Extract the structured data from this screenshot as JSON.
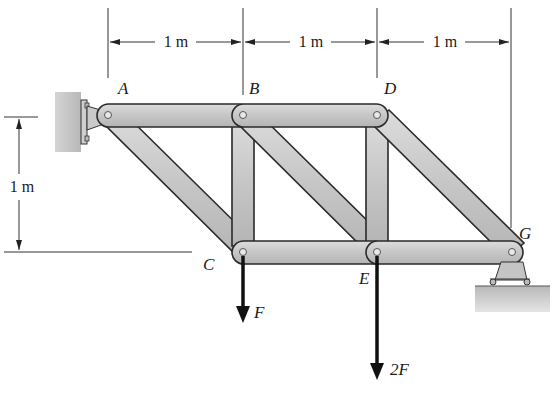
{
  "figure": {
    "type": "truss-diagram",
    "dimensions": {
      "horizontal": [
        {
          "label": "1 m",
          "from": "A",
          "to": "B"
        },
        {
          "label": "1 m",
          "from": "B",
          "to": "D"
        },
        {
          "label": "1 m",
          "from": "D",
          "to": "G"
        }
      ],
      "vertical": {
        "label": "1 m",
        "from": "A",
        "to": "C"
      }
    },
    "joints": {
      "A": {
        "label": "A"
      },
      "B": {
        "label": "B"
      },
      "C": {
        "label": "C"
      },
      "D": {
        "label": "D"
      },
      "E": {
        "label": "E"
      },
      "G": {
        "label": "G"
      }
    },
    "members": [
      "AB",
      "BD",
      "AC",
      "BC",
      "BE",
      "DE",
      "DG",
      "CE",
      "EG"
    ],
    "supports": {
      "A": "pin (wall)",
      "G": "roller (ground)"
    },
    "loads": [
      {
        "joint": "C",
        "label": "F",
        "direction": "down"
      },
      {
        "joint": "E",
        "label": "2F",
        "direction": "down"
      }
    ],
    "colors": {
      "member_fill": "#c8c8c8",
      "member_stroke": "#2a2a2a",
      "support_fill": "#c0c0c0",
      "load_arrow": "#111111",
      "dimension_line": "#333333"
    }
  }
}
